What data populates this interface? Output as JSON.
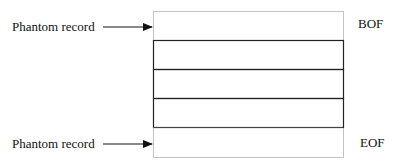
{
  "diagram": {
    "type": "file-record-layout",
    "labels": {
      "top_phantom": "Phantom record",
      "bottom_phantom": "Phantom record",
      "bof": "BOF",
      "eof": "EOF"
    },
    "records": [
      {
        "kind": "phantom",
        "style": "dotted",
        "marker": "BOF"
      },
      {
        "kind": "record",
        "style": "solid"
      },
      {
        "kind": "record",
        "style": "solid"
      },
      {
        "kind": "record",
        "style": "solid"
      },
      {
        "kind": "phantom",
        "style": "dotted",
        "marker": "EOF"
      }
    ],
    "colors": {
      "line": "#222222",
      "dotted": "#888888",
      "text": "#111111",
      "background": "#ffffff"
    }
  }
}
